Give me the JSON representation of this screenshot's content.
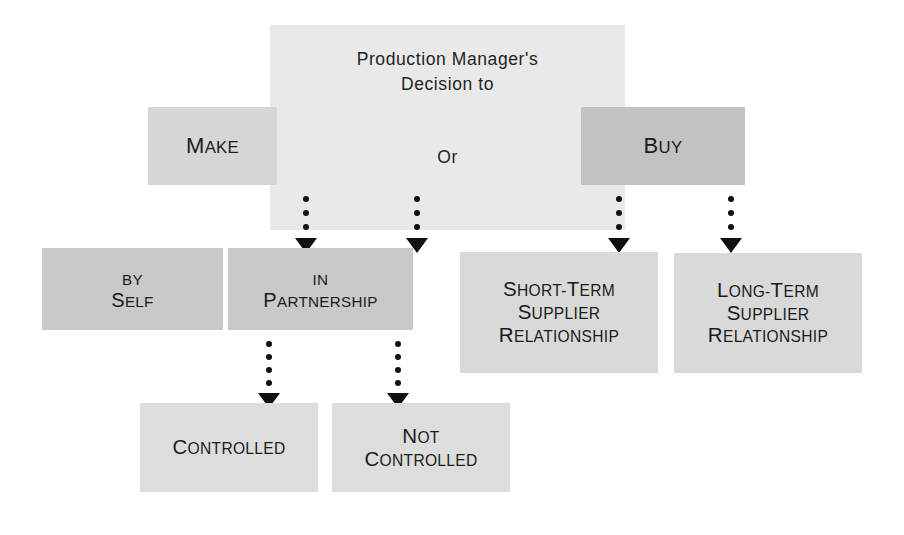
{
  "diagram": {
    "background_color": "#ffffff",
    "text_color": "#1b1b1b"
  },
  "header": {
    "title_line1": "Production Manager's",
    "title_line2": "Decision to",
    "connector": "Or",
    "fill_color": "#e9e9e9"
  },
  "options": {
    "make": {
      "cap": "M",
      "rest": "ake",
      "full": "Make",
      "fill_color": "#d6d6d6"
    },
    "buy": {
      "cap": "B",
      "rest": "uy",
      "full": "Buy",
      "fill_color": "#c2c2c2"
    }
  },
  "make_branch": {
    "by_self": {
      "line1_cap": "B",
      "line1_rest": "y",
      "line1_full": "By",
      "line2_cap": "S",
      "line2_rest": "elf",
      "line2_full": "Self",
      "fill_color": "#c9c9c9"
    },
    "in_partnership": {
      "line1_cap": "I",
      "line1_rest": "n",
      "line1_full": "In",
      "line2_cap": "P",
      "line2_rest": "artnership",
      "line2_full": "Partnership",
      "fill_color": "#c9c9c9"
    }
  },
  "partnership_outcomes": {
    "controlled": {
      "cap": "C",
      "rest": "ontrolled",
      "full": "Controlled",
      "fill_color": "#dddddd"
    },
    "not_controlled": {
      "line1_cap": "N",
      "line1_rest": "ot",
      "line1_full": "Not",
      "line2_cap": "C",
      "line2_rest": "ontrolled",
      "line2_full": "Controlled",
      "fill_color": "#dddddd"
    }
  },
  "buy_branch": {
    "short_term": {
      "line1_cap": "S",
      "line1_mid": "hort-",
      "line1_cap2": "T",
      "line1_rest": "erm",
      "line1_full": "Short-Term",
      "line2_cap": "S",
      "line2_rest": "upplier",
      "line2_full": "Supplier",
      "line3_cap": "R",
      "line3_rest": "elationship",
      "line3_full": "Relationship",
      "fill_color": "#d9d9d9"
    },
    "long_term": {
      "line1_cap": "L",
      "line1_mid": "ong-",
      "line1_cap2": "T",
      "line1_rest": "erm",
      "line1_full": "Long-Term",
      "line2_cap": "S",
      "line2_rest": "upplier",
      "line2_full": "Supplier",
      "line3_cap": "R",
      "line3_rest": "elationship",
      "line3_full": "Relationship",
      "fill_color": "#d9d9d9"
    }
  },
  "connectors": {
    "style": "dotted-down-arrow",
    "color": "#101010",
    "arrows": [
      {
        "name": "make-to-by-self",
        "dots": 3
      },
      {
        "name": "make-to-in-partnership",
        "dots": 3
      },
      {
        "name": "buy-to-short-term",
        "dots": 3
      },
      {
        "name": "buy-to-long-term",
        "dots": 3
      },
      {
        "name": "in-partnership-to-controlled",
        "dots": 4
      },
      {
        "name": "in-partnership-to-not-controlled",
        "dots": 4
      }
    ]
  }
}
